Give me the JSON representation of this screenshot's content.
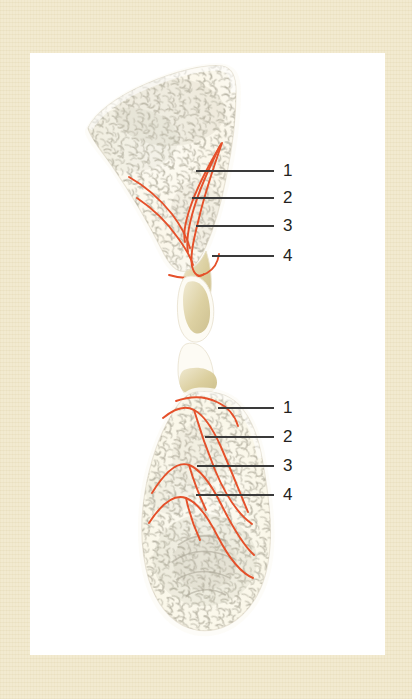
{
  "figure": {
    "kind": "anatomical-illustration",
    "background_color": "#f2ead0",
    "panel_color": "#ffffff",
    "leader_line_color": "#3a3a3a",
    "anatomy_line_color": "#e5502a",
    "bone_fill_color": "#fbf8ee",
    "bone_outline_color": "#e8e3d6",
    "trabecula_color": "#b6b2a2",
    "cartilage_color": "#d8cc9a"
  },
  "upper_specimen": {
    "name": "upper-bone-specimen",
    "labels": [
      {
        "id": "u1",
        "text": "1",
        "line_x1": 196,
        "line_x2": 274,
        "line_y": 171,
        "num_x": 283,
        "num_y": 162
      },
      {
        "id": "u2",
        "text": "2",
        "line_x1": 192,
        "line_x2": 274,
        "line_y": 198,
        "num_x": 283,
        "num_y": 189
      },
      {
        "id": "u3",
        "text": "3",
        "line_x1": 196,
        "line_x2": 274,
        "line_y": 226,
        "num_x": 283,
        "num_y": 217
      },
      {
        "id": "u4",
        "text": "4",
        "line_x1": 212,
        "line_x2": 274,
        "line_y": 256,
        "num_x": 283,
        "num_y": 247
      }
    ]
  },
  "lower_specimen": {
    "name": "lower-bone-specimen",
    "labels": [
      {
        "id": "l1",
        "text": "1",
        "line_x1": 218,
        "line_x2": 274,
        "line_y": 408,
        "num_x": 283,
        "num_y": 399
      },
      {
        "id": "l2",
        "text": "2",
        "line_x1": 205,
        "line_x2": 274,
        "line_y": 437,
        "num_x": 283,
        "num_y": 428
      },
      {
        "id": "l3",
        "text": "3",
        "line_x1": 197,
        "line_x2": 274,
        "line_y": 466,
        "num_x": 283,
        "num_y": 457
      },
      {
        "id": "l4",
        "text": "4",
        "line_x1": 196,
        "line_x2": 274,
        "line_y": 495,
        "num_x": 283,
        "num_y": 486
      }
    ]
  },
  "legend_numbers": [
    "1",
    "2",
    "3",
    "4"
  ]
}
